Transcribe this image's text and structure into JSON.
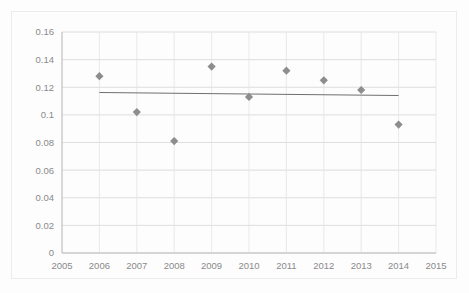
{
  "chart_data": {
    "type": "scatter",
    "title": "",
    "xlabel": "",
    "ylabel": "",
    "x": [
      2006,
      2007,
      2008,
      2009,
      2010,
      2011,
      2012,
      2013,
      2014
    ],
    "values": [
      0.128,
      0.102,
      0.081,
      0.135,
      0.113,
      0.132,
      0.125,
      0.118,
      0.093
    ],
    "series": [
      {
        "name": "observations",
        "marker": "diamond",
        "color": "#8d8d8d",
        "x": [
          2006,
          2007,
          2008,
          2009,
          2010,
          2011,
          2012,
          2013,
          2014
        ],
        "values": [
          0.128,
          0.102,
          0.081,
          0.135,
          0.113,
          0.132,
          0.125,
          0.118,
          0.093
        ]
      },
      {
        "name": "trendline",
        "type": "line",
        "color": "#6f6f6f",
        "x": [
          2006,
          2014
        ],
        "values": [
          0.1162,
          0.114
        ]
      }
    ],
    "xlim": [
      2005,
      2015
    ],
    "ylim": [
      0,
      0.16
    ],
    "xticks": [
      2005,
      2006,
      2007,
      2008,
      2009,
      2010,
      2011,
      2012,
      2013,
      2014,
      2015
    ],
    "xtick_labels": [
      "2005",
      "2006",
      "2007",
      "2008",
      "2009",
      "2010",
      "2011",
      "2012",
      "2013",
      "2014",
      "2015"
    ],
    "yticks": [
      0,
      0.02,
      0.04,
      0.06,
      0.08,
      0.1,
      0.12,
      0.14,
      0.16
    ],
    "ytick_labels": [
      "0",
      "0.02",
      "0.04",
      "0.06",
      "0.08",
      "0.1",
      "0.12",
      "0.14",
      "0.16"
    ],
    "grid": {
      "horizontal": true,
      "vertical": true
    },
    "legend": {
      "visible": false,
      "position": "none"
    }
  }
}
